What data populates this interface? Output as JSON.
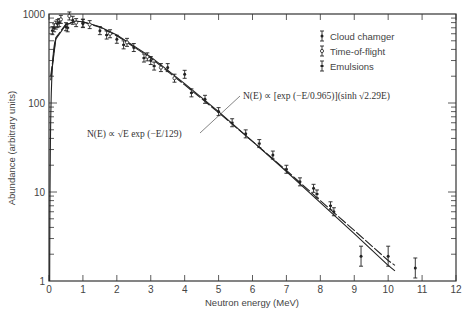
{
  "chart_data": {
    "type": "scatter",
    "title": "",
    "xlabel": "Neutron energy (MeV)",
    "ylabel": "Abundance (arbitrary units)",
    "xlim": [
      0,
      12
    ],
    "ylim": [
      1,
      1000
    ],
    "yscale": "log",
    "x_ticks": [
      "0",
      "1",
      "2",
      "3",
      "4",
      "5",
      "6",
      "7",
      "8",
      "9",
      "10",
      "11",
      "12"
    ],
    "y_ticks": [
      "1",
      "10",
      "100",
      "1000"
    ],
    "grid": false,
    "legend_position": "upper right",
    "legend": [
      {
        "name": "Cloud chamger",
        "marker": "filled-circle-errorbar"
      },
      {
        "name": "Time-of-flight",
        "marker": "open-circle-errorbar"
      },
      {
        "name": "Emulsions",
        "marker": "bar-errorbar"
      }
    ],
    "annotations": [
      {
        "text": "N(E) ∝ [exp (−E/0.965)](sinh √2.29E)",
        "curve": "watt-spectrum"
      },
      {
        "text": "N(E) ∝ √E exp (−E/129)",
        "curve": "maxwellian"
      }
    ],
    "series": [
      {
        "name": "Cloud chamger",
        "x": [
          0.15,
          0.3,
          0.5,
          0.7,
          1.0,
          1.5,
          2.0,
          2.5,
          3.0,
          3.5,
          4.0,
          4.6,
          5.0,
          5.8,
          6.6,
          7.4,
          7.8,
          8.4,
          9.2,
          10.0,
          10.8
        ],
        "y": [
          700,
          800,
          720,
          850,
          780,
          650,
          520,
          420,
          300,
          250,
          210,
          110,
          80,
          45,
          26,
          13,
          11,
          6,
          1.9,
          1.9,
          1.4
        ]
      },
      {
        "name": "Time-of-flight",
        "x": [
          0.2,
          0.35,
          0.6,
          0.8,
          1.2,
          1.8,
          2.3,
          2.9,
          3.3,
          3.7
        ],
        "y": [
          750,
          870,
          950,
          800,
          760,
          600,
          480,
          330,
          250,
          190
        ]
      },
      {
        "name": "Emulsions",
        "x": [
          0.1,
          0.25,
          0.55,
          1.0,
          1.7,
          2.2,
          2.8,
          3.1,
          4.2,
          5.4,
          6.2,
          7.0,
          7.9,
          8.3
        ],
        "y": [
          650,
          780,
          700,
          790,
          580,
          450,
          320,
          260,
          130,
          60,
          35,
          18,
          9.5,
          7
        ]
      }
    ],
    "curves": [
      {
        "name": "Watt fit",
        "x": [
          0.05,
          0.2,
          0.5,
          0.8,
          1,
          1.5,
          2,
          3,
          4,
          5,
          6,
          7,
          8,
          9,
          10,
          10.2
        ],
        "y": [
          180,
          520,
          760,
          830,
          820,
          720,
          580,
          330,
          165,
          80,
          37,
          17,
          7.6,
          3.4,
          1.5,
          1.3
        ]
      },
      {
        "name": "Maxwellian fit",
        "x": [
          0.05,
          0.2,
          0.5,
          0.8,
          1,
          1.5,
          2,
          3,
          4,
          5,
          6,
          7,
          8,
          9,
          10,
          10.2
        ],
        "y": [
          200,
          540,
          770,
          830,
          815,
          710,
          570,
          320,
          160,
          78,
          37,
          17.5,
          8,
          3.7,
          1.7,
          1.5
        ]
      }
    ]
  }
}
